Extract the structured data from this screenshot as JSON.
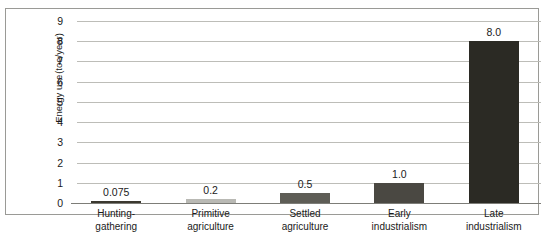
{
  "chart_data": {
    "type": "bar",
    "title": "",
    "xlabel": "",
    "ylabel": "Energy use (toe/year)",
    "ylabel_line1": "Energy use",
    "ylabel_line2": "(toe/year)",
    "ylim": [
      0,
      9
    ],
    "ytick_labels": [
      "0",
      "1",
      "2",
      "3",
      "4",
      "5",
      "6",
      "7",
      "8",
      "9"
    ],
    "ytick_values": [
      0,
      1,
      2,
      3,
      4,
      5,
      6,
      7,
      8,
      9
    ],
    "grid": true,
    "legend": "none",
    "categories": [
      "Hunting-gathering",
      "Primitive agriculture",
      "Settled agriculture",
      "Early industrialism",
      "Late industrialism"
    ],
    "category_lines": [
      [
        "Hunting-",
        "gathering"
      ],
      [
        "Primitive",
        "agriculture"
      ],
      [
        "Settled",
        "agriculture"
      ],
      [
        "Early",
        "industrialism"
      ],
      [
        "Late",
        "industrialism"
      ]
    ],
    "values": [
      0.075,
      0.2,
      0.5,
      1.0,
      8.0
    ],
    "value_labels": [
      "0.075",
      "0.2",
      "0.5",
      "1.0",
      "8.0"
    ],
    "bar_colors": [
      "#3b382f",
      "#b9b9b4",
      "#5e5d56",
      "#4a4842",
      "#2b2a24"
    ]
  },
  "style": {
    "frame_color": "#9a9a96",
    "gridline_color": "#bdbdb8",
    "axis_color": "#7d7d78",
    "text_color": "#1a1a1a",
    "background": "#ffffff"
  }
}
